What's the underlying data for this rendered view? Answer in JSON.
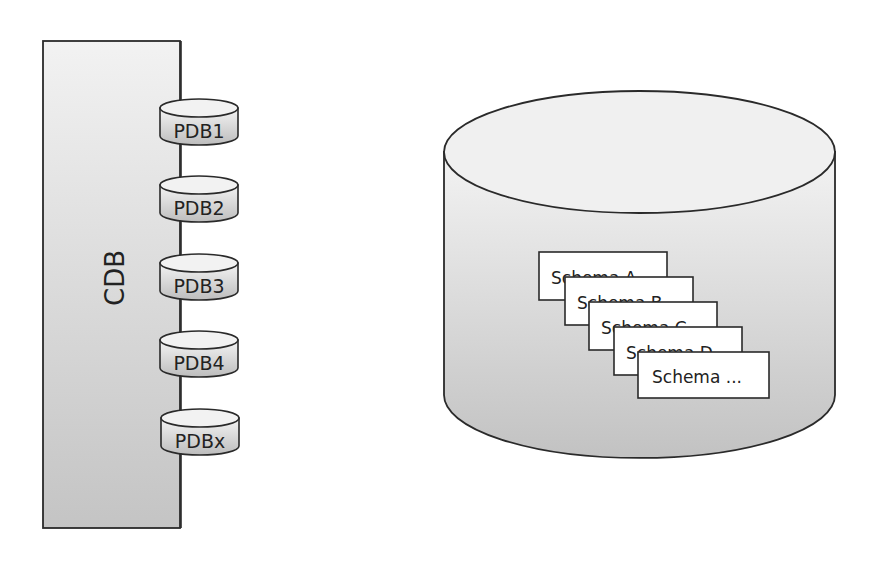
{
  "left_diagram": {
    "container_label": "CDB",
    "pdbs": [
      {
        "label": "PDB1"
      },
      {
        "label": "PDB2"
      },
      {
        "label": "PDB3"
      },
      {
        "label": "PDB4"
      },
      {
        "label": "PDBx"
      }
    ]
  },
  "right_diagram": {
    "schemas": [
      {
        "label": "Schema A"
      },
      {
        "label": "Schema B"
      },
      {
        "label": "Schema C"
      },
      {
        "label": "Schema D"
      },
      {
        "label": "Schema ..."
      }
    ]
  },
  "colors": {
    "stroke": "#2a2a2a",
    "fill_light": "#f0f0f0",
    "fill_dark": "#c8c8c8",
    "schema_fill": "#ffffff"
  }
}
